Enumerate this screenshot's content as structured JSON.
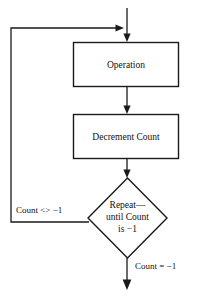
{
  "diagram": {
    "type": "flowchart",
    "colors": {
      "background": "#ffffff",
      "stroke": "#1a1a1a",
      "text": "#111111",
      "shape_fill": "#ffffff"
    },
    "nodes": {
      "operation": {
        "shape": "rectangle",
        "label": "Operation"
      },
      "decrement": {
        "shape": "rectangle",
        "label": "Decrement Count"
      },
      "decision": {
        "shape": "diamond",
        "line1": "Repeat—",
        "line2": "until Count",
        "line3": "is −1"
      }
    },
    "edge_labels": {
      "loop_back": "Count <> −1",
      "exit": "Count = −1"
    }
  }
}
